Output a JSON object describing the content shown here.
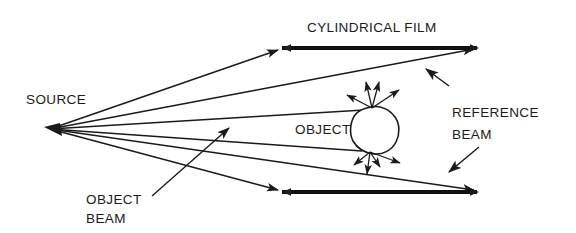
{
  "figure": {
    "type": "schematic-diagram",
    "width": 576,
    "height": 233,
    "background_color": "#ffffff",
    "ink_color": "#1a1a1a"
  },
  "labels": {
    "source": "SOURCE",
    "cylindrical_film": "CYLINDRICAL FILM",
    "object": "OBJECT",
    "reference_beam_line1": "REFERENCE",
    "reference_beam_line2": "BEAM",
    "object_beam_line1": "OBJECT",
    "object_beam_line2": "BEAM"
  },
  "elements": {
    "source_point": {
      "x": 50,
      "y": 129
    },
    "film_top": {
      "x1": 279,
      "y1": 48,
      "x2": 479,
      "y2": 48
    },
    "film_bottom": {
      "x1": 279,
      "y1": 192,
      "x2": 479,
      "y2": 192
    },
    "object_blob_center": {
      "x": 372,
      "y": 130
    },
    "scatter_point_upper": {
      "x": 372,
      "y": 108
    },
    "scatter_point_lower": {
      "x": 370,
      "y": 152
    },
    "reference_arrow_upper": {
      "x1": 449,
      "y1": 86,
      "x2": 424,
      "y2": 67
    },
    "reference_arrow_lower": {
      "x1": 479,
      "y1": 147,
      "x2": 446,
      "y2": 175
    },
    "object_beam_leader": {
      "x1": 152,
      "y1": 196,
      "x2": 231,
      "y2": 126
    }
  },
  "rays": [
    {
      "name": "ray-to-film-top-left",
      "x1": 50,
      "y1": 129,
      "x2": 281,
      "y2": 49
    },
    {
      "name": "ray-to-film-top-right",
      "x1": 50,
      "y1": 129,
      "x2": 477,
      "y2": 49
    },
    {
      "name": "ray-to-object-upper",
      "x1": 50,
      "y1": 129,
      "x2": 366,
      "y2": 110
    },
    {
      "name": "ray-to-object-lower",
      "x1": 50,
      "y1": 129,
      "x2": 364,
      "y2": 151
    },
    {
      "name": "ray-to-film-bottom-right",
      "x1": 50,
      "y1": 129,
      "x2": 477,
      "y2": 191
    },
    {
      "name": "ray-to-film-bottom-left",
      "x1": 50,
      "y1": 129,
      "x2": 281,
      "y2": 191
    }
  ],
  "scatter_arrows_upper": [
    {
      "x2": 345,
      "y2": 94
    },
    {
      "x2": 366,
      "y2": 80
    },
    {
      "x2": 379,
      "y2": 80
    },
    {
      "x2": 400,
      "y2": 88
    }
  ],
  "scatter_arrows_lower": [
    {
      "x2": 352,
      "y2": 166
    },
    {
      "x2": 366,
      "y2": 175
    },
    {
      "x2": 379,
      "y2": 168
    },
    {
      "x2": 401,
      "y2": 163
    }
  ]
}
